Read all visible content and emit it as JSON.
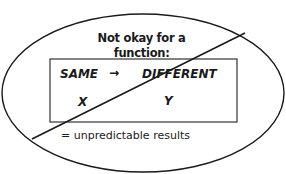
{
  "diagram": {
    "title": "Not okay for a function:",
    "mapping": {
      "left_label": "SAME",
      "arrow": "→",
      "right_label": "DIFFERENT",
      "left_variable": "X",
      "right_variable": "Y"
    },
    "note": "= unpredictable results",
    "shapes": {
      "ellipse": {
        "cx": 143,
        "cy": 93,
        "rx": 141,
        "ry": 79
      },
      "rectangle": {
        "x": 50,
        "y": 59,
        "width": 187,
        "height": 63
      },
      "strike_line": {
        "x1": 32,
        "y1": 139,
        "x2": 245,
        "y2": 33
      }
    },
    "stroke_color": "#1a1a1a"
  }
}
